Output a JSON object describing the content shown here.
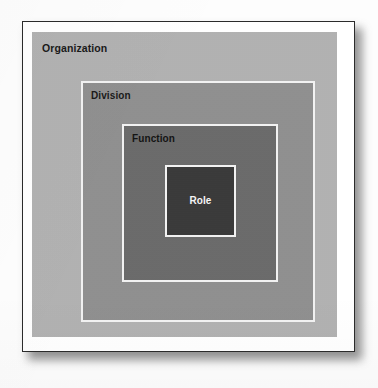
{
  "figure": {
    "type": "nested-squares-hierarchy",
    "levels": [
      {
        "id": "organization",
        "label": "Organization",
        "depth": 1,
        "fill": "#b2b2b2",
        "border": "none",
        "label_color": "#1a1a1a"
      },
      {
        "id": "division",
        "label": "Division",
        "depth": 2,
        "fill": "#909090",
        "border": "#f2f2f2",
        "label_color": "#1a1a1a"
      },
      {
        "id": "function",
        "label": "Function",
        "depth": 3,
        "fill": "#6b6b6b",
        "border": "#f2f2f2",
        "label_color": "#141414"
      },
      {
        "id": "role",
        "label": "Role",
        "depth": 4,
        "fill": "#3a3a3a",
        "border": "#f2f2f2",
        "label_color": "#f4f4f4"
      }
    ]
  },
  "page": {
    "background": "#fdfdfd",
    "frame_border_color": "#2b2b2b",
    "frame_fill": "#ffffff"
  }
}
